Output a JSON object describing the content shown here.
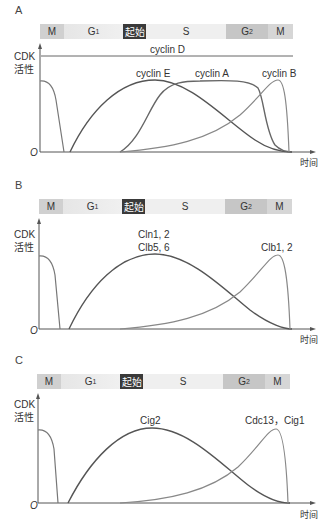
{
  "phases": {
    "M1": "M",
    "G1": "G",
    "G1_sub": "1",
    "start": "起始",
    "S": "S",
    "G2": "G",
    "G2_sub": "2",
    "M2": "M"
  },
  "colors": {
    "m_segment": "#d0d0d0",
    "g1_segment": "#eeeeee",
    "start_segment": "#3a3a3a",
    "s_segment": "#eeeeee",
    "g2_segment": "#c4c4c4",
    "m2_segment": "#d6d6d6",
    "curve_dark": "#555555",
    "curve_light": "#888888"
  },
  "axes": {
    "ylabel_line1": "CDK",
    "ylabel_line2": "活性",
    "xlabel": "时间",
    "origin": "O"
  },
  "panels": [
    {
      "label": "A",
      "curves": [
        "cyclin D",
        "cyclin E",
        "cyclin A",
        "cyclin B"
      ]
    },
    {
      "label": "B",
      "curves": [
        "Cln1, 2",
        "Clb5, 6",
        "Clb1, 2"
      ]
    },
    {
      "label": "C",
      "curves": [
        "Cig2",
        "Cdc13，Cig1"
      ]
    }
  ]
}
